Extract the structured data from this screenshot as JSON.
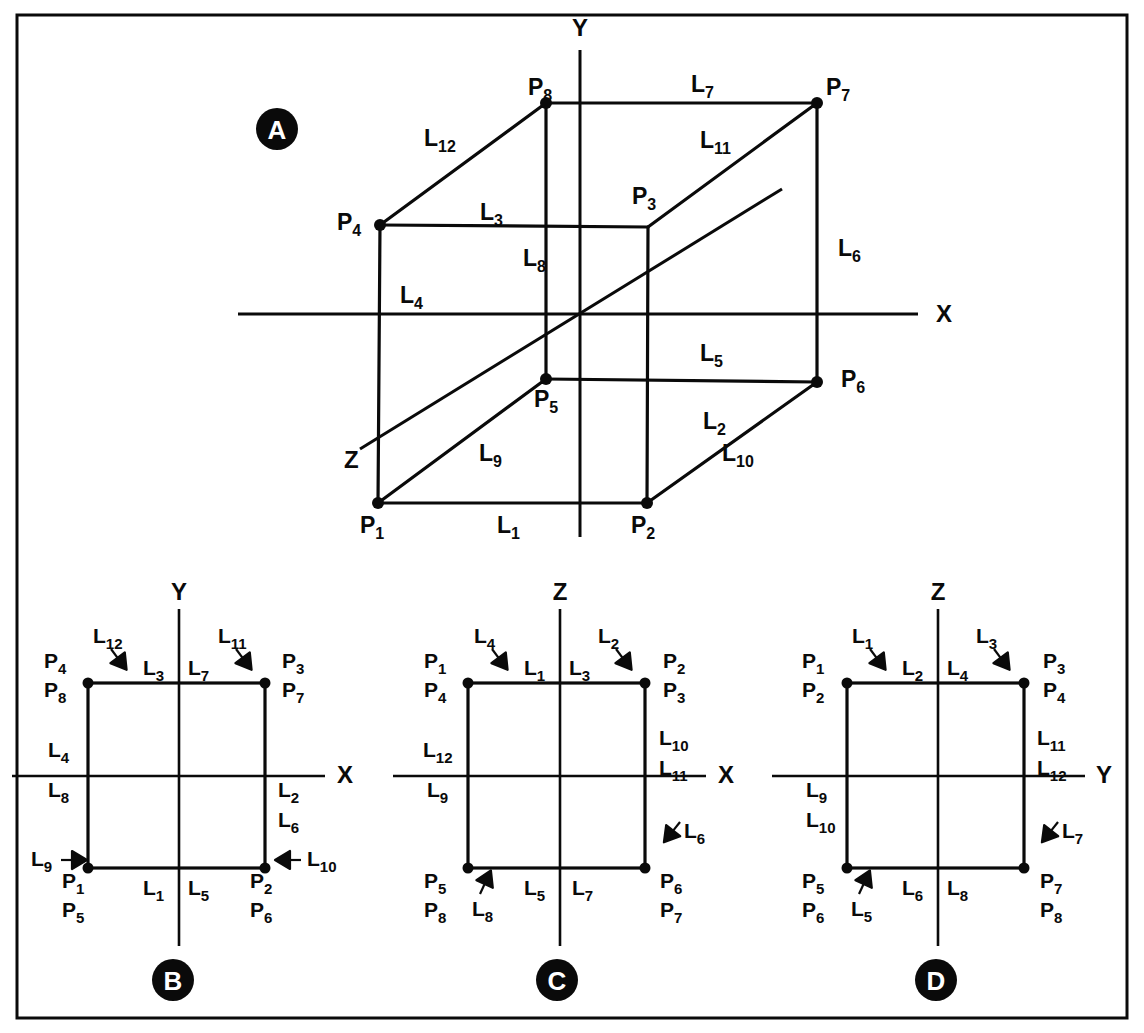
{
  "figure": {
    "background_color": "#ffffff",
    "ink_color": "#0a0a0a",
    "frame": {
      "x": 17,
      "y": 15,
      "width": 1110,
      "height": 1003
    }
  },
  "panels": [
    {
      "id": "A",
      "badge": "A",
      "badge_center": {
        "x": 277,
        "y": 129
      },
      "type": "isometric-cube",
      "axes": [
        {
          "name": "X",
          "label": "X",
          "label_pos": {
            "x": 936,
            "y": 322
          }
        },
        {
          "name": "Y",
          "label": "Y",
          "label_pos": {
            "x": 580,
            "y": 36
          }
        },
        {
          "name": "Z",
          "label": "Z",
          "label_pos": {
            "x": 344,
            "y": 468
          }
        }
      ],
      "vertices": [
        {
          "id": "P1",
          "base": "P",
          "sub": "1",
          "x": 378,
          "y": 503,
          "label_x": 360,
          "label_y": 533,
          "dot": true
        },
        {
          "id": "P2",
          "base": "P",
          "sub": "2",
          "x": 647,
          "y": 503,
          "label_x": 631,
          "label_y": 533,
          "dot": true
        },
        {
          "id": "P3",
          "base": "P",
          "sub": "3",
          "x": 648,
          "y": 227,
          "label_x": 632,
          "label_y": 204,
          "dot": false
        },
        {
          "id": "P4",
          "base": "P",
          "sub": "4",
          "x": 380,
          "y": 225,
          "label_x": 337,
          "label_y": 230,
          "dot": true
        },
        {
          "id": "P5",
          "base": "P",
          "sub": "5",
          "x": 546,
          "y": 379,
          "label_x": 534,
          "label_y": 407,
          "dot": true
        },
        {
          "id": "P6",
          "base": "P",
          "sub": "6",
          "x": 817,
          "y": 382,
          "label_x": 841,
          "label_y": 387,
          "dot": true
        },
        {
          "id": "P7",
          "base": "P",
          "sub": "7",
          "x": 817,
          "y": 103,
          "label_x": 826,
          "label_y": 95,
          "dot": true
        },
        {
          "id": "P8",
          "base": "P",
          "sub": "8",
          "x": 546,
          "y": 103,
          "label_x": 528,
          "label_y": 95,
          "dot": true
        }
      ],
      "edge_labels": [
        {
          "id": "L1",
          "base": "L",
          "sub": "1",
          "x": 497,
          "y": 533
        },
        {
          "id": "L2",
          "base": "L",
          "sub": "2",
          "x": 703,
          "y": 429
        },
        {
          "id": "L3",
          "base": "L",
          "sub": "3",
          "x": 480,
          "y": 220
        },
        {
          "id": "L4",
          "base": "L",
          "sub": "4",
          "x": 400,
          "y": 303
        },
        {
          "id": "L5",
          "base": "L",
          "sub": "5",
          "x": 700,
          "y": 361
        },
        {
          "id": "L6",
          "base": "L",
          "sub": "6",
          "x": 838,
          "y": 256
        },
        {
          "id": "L7",
          "base": "L",
          "sub": "7",
          "x": 691,
          "y": 92
        },
        {
          "id": "L8",
          "base": "L",
          "sub": "8",
          "x": 523,
          "y": 266
        },
        {
          "id": "L9",
          "base": "L",
          "sub": "9",
          "x": 479,
          "y": 461
        },
        {
          "id": "L10",
          "base": "L",
          "sub": "10",
          "x": 722,
          "y": 461
        },
        {
          "id": "L11",
          "base": "L",
          "sub": "11",
          "x": 700,
          "y": 148
        },
        {
          "id": "L12",
          "base": "L",
          "sub": "12",
          "x": 424,
          "y": 146
        }
      ]
    },
    {
      "id": "B",
      "badge": "B",
      "badge_center": {
        "x": 173,
        "y": 980
      },
      "type": "projection",
      "axis_horizontal": "X",
      "axis_vertical": "Y",
      "axis_h_label_pos": {
        "x": 337,
        "y": 783
      },
      "axis_v_label_pos": {
        "x": 179,
        "y": 600
      },
      "corner_point_labels": [
        {
          "corner": "top-left",
          "lines": [
            "P4",
            "P8"
          ],
          "x": 44,
          "y": 668
        },
        {
          "corner": "top-right",
          "lines": [
            "P3",
            "P7"
          ],
          "x": 282,
          "y": 668
        },
        {
          "corner": "bottom-left",
          "lines": [
            "P1",
            "P5"
          ],
          "x": 62,
          "y": 888
        },
        {
          "corner": "bottom-right",
          "lines": [
            "P2",
            "P6"
          ],
          "x": 250,
          "y": 888
        }
      ],
      "edge_labels": [
        {
          "id": "L12",
          "base": "L",
          "sub": "12",
          "x": 93,
          "y": 643,
          "arrow": "down-right"
        },
        {
          "id": "L11",
          "base": "L",
          "sub": "11",
          "x": 218,
          "y": 643,
          "arrow": "down-right"
        },
        {
          "id": "L3",
          "base": "L",
          "sub": "3",
          "x": 143,
          "y": 675,
          "arrow": null
        },
        {
          "id": "L7",
          "base": "L",
          "sub": "7",
          "x": 188,
          "y": 675,
          "arrow": null
        },
        {
          "id": "L4",
          "base": "L",
          "sub": "4",
          "x": 48,
          "y": 757,
          "arrow": null
        },
        {
          "id": "L8",
          "base": "L",
          "sub": "8",
          "x": 48,
          "y": 797,
          "arrow": null
        },
        {
          "id": "L2",
          "base": "L",
          "sub": "2",
          "x": 278,
          "y": 797,
          "arrow": null
        },
        {
          "id": "L6",
          "base": "L",
          "sub": "6",
          "x": 278,
          "y": 827,
          "arrow": null
        },
        {
          "id": "L9",
          "base": "L",
          "sub": "9",
          "x": 31,
          "y": 866,
          "arrow": "right"
        },
        {
          "id": "L10",
          "base": "L",
          "sub": "10",
          "x": 307,
          "y": 866,
          "arrow": "left"
        },
        {
          "id": "L1",
          "base": "L",
          "sub": "1",
          "x": 143,
          "y": 895,
          "arrow": null
        },
        {
          "id": "L5",
          "base": "L",
          "sub": "5",
          "x": 188,
          "y": 895,
          "arrow": null
        }
      ]
    },
    {
      "id": "C",
      "badge": "C",
      "badge_center": {
        "x": 557,
        "y": 980
      },
      "type": "projection",
      "axis_horizontal": "X",
      "axis_vertical": "Z",
      "axis_h_label_pos": {
        "x": 718,
        "y": 783
      },
      "axis_v_label_pos": {
        "x": 560,
        "y": 600
      },
      "corner_point_labels": [
        {
          "corner": "top-left",
          "lines": [
            "P1",
            "P4"
          ],
          "x": 424,
          "y": 668
        },
        {
          "corner": "top-right",
          "lines": [
            "P2",
            "P3"
          ],
          "x": 663,
          "y": 668
        },
        {
          "corner": "bottom-left",
          "lines": [
            "P5",
            "P8"
          ],
          "x": 424,
          "y": 888
        },
        {
          "corner": "bottom-right",
          "lines": [
            "P6",
            "P7"
          ],
          "x": 660,
          "y": 888
        }
      ],
      "edge_labels": [
        {
          "id": "L4",
          "base": "L",
          "sub": "4",
          "x": 474,
          "y": 643,
          "arrow": "down-right"
        },
        {
          "id": "L2",
          "base": "L",
          "sub": "2",
          "x": 598,
          "y": 643,
          "arrow": "down-right"
        },
        {
          "id": "L1",
          "base": "L",
          "sub": "1",
          "x": 524,
          "y": 675,
          "arrow": null
        },
        {
          "id": "L3",
          "base": "L",
          "sub": "3",
          "x": 569,
          "y": 675,
          "arrow": null
        },
        {
          "id": "L10",
          "base": "L",
          "sub": "10",
          "x": 659,
          "y": 745,
          "arrow": null
        },
        {
          "id": "L11",
          "base": "L",
          "sub": "11",
          "x": 659,
          "y": 775,
          "arrow": null
        },
        {
          "id": "L12",
          "base": "L",
          "sub": "12",
          "x": 423,
          "y": 757,
          "arrow": null
        },
        {
          "id": "L9",
          "base": "L",
          "sub": "9",
          "x": 427,
          "y": 797,
          "arrow": null
        },
        {
          "id": "L6",
          "base": "L",
          "sub": "6",
          "x": 684,
          "y": 838,
          "arrow": "down-left"
        },
        {
          "id": "L8",
          "base": "L",
          "sub": "8",
          "x": 472,
          "y": 916,
          "arrow": "up-right"
        },
        {
          "id": "L5",
          "base": "L",
          "sub": "5",
          "x": 524,
          "y": 895,
          "arrow": null
        },
        {
          "id": "L7",
          "base": "L",
          "sub": "7",
          "x": 572,
          "y": 895,
          "arrow": null
        }
      ]
    },
    {
      "id": "D",
      "badge": "D",
      "badge_center": {
        "x": 936,
        "y": 980
      },
      "type": "projection",
      "axis_horizontal": "Y",
      "axis_vertical": "Z",
      "axis_h_label_pos": {
        "x": 1096,
        "y": 783
      },
      "axis_v_label_pos": {
        "x": 938,
        "y": 600
      },
      "corner_point_labels": [
        {
          "corner": "top-left",
          "lines": [
            "P1",
            "P2"
          ],
          "x": 802,
          "y": 668
        },
        {
          "corner": "top-right",
          "lines": [
            "P3",
            "P4"
          ],
          "x": 1043,
          "y": 668
        },
        {
          "corner": "bottom-left",
          "lines": [
            "P5",
            "P6"
          ],
          "x": 802,
          "y": 888
        },
        {
          "corner": "bottom-right",
          "lines": [
            "P7",
            "P8"
          ],
          "x": 1040,
          "y": 888
        }
      ],
      "edge_labels": [
        {
          "id": "L1",
          "base": "L",
          "sub": "1",
          "x": 852,
          "y": 643,
          "arrow": "down-right"
        },
        {
          "id": "L3",
          "base": "L",
          "sub": "3",
          "x": 976,
          "y": 643,
          "arrow": "down-right"
        },
        {
          "id": "L2",
          "base": "L",
          "sub": "2",
          "x": 902,
          "y": 675,
          "arrow": null
        },
        {
          "id": "L4",
          "base": "L",
          "sub": "4",
          "x": 947,
          "y": 675,
          "arrow": null
        },
        {
          "id": "L11",
          "base": "L",
          "sub": "11",
          "x": 1037,
          "y": 745,
          "arrow": null
        },
        {
          "id": "L12",
          "base": "L",
          "sub": "12",
          "x": 1037,
          "y": 775,
          "arrow": null
        },
        {
          "id": "L9",
          "base": "L",
          "sub": "9",
          "x": 806,
          "y": 797,
          "arrow": null
        },
        {
          "id": "L10",
          "base": "L",
          "sub": "10",
          "x": 806,
          "y": 827,
          "arrow": null
        },
        {
          "id": "L7",
          "base": "L",
          "sub": "7",
          "x": 1062,
          "y": 838,
          "arrow": "down-left"
        },
        {
          "id": "L5",
          "base": "L",
          "sub": "5",
          "x": 851,
          "y": 916,
          "arrow": "up-right"
        },
        {
          "id": "L6",
          "base": "L",
          "sub": "6",
          "x": 902,
          "y": 895,
          "arrow": null
        },
        {
          "id": "L8",
          "base": "L",
          "sub": "8",
          "x": 947,
          "y": 895,
          "arrow": null
        }
      ]
    }
  ],
  "projection_geometry": {
    "square_width": 177,
    "square_height": 185,
    "panels": {
      "B": {
        "left": 88,
        "right": 265,
        "top": 683,
        "bottom": 868,
        "cx": 179,
        "cy": 776,
        "axis_h_start": 12,
        "axis_h_end": 325,
        "axis_v_top": 609,
        "axis_v_bottom": 946
      },
      "C": {
        "left": 468,
        "right": 645,
        "top": 683,
        "bottom": 868,
        "cx": 560,
        "cy": 776,
        "axis_h_start": 393,
        "axis_h_end": 706,
        "axis_v_top": 609,
        "axis_v_bottom": 946
      },
      "D": {
        "left": 847,
        "right": 1024,
        "top": 683,
        "bottom": 868,
        "cx": 938,
        "cy": 776,
        "axis_h_start": 772,
        "axis_h_end": 1085,
        "axis_v_top": 609,
        "axis_v_bottom": 946
      }
    }
  }
}
